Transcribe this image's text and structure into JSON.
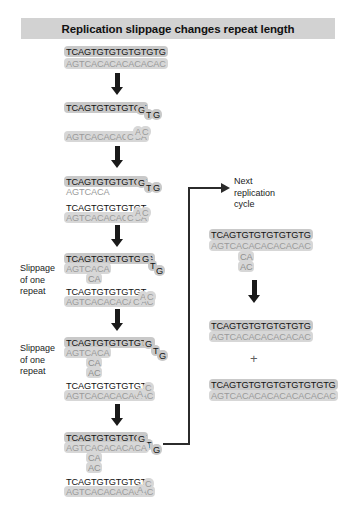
{
  "title": "Replication slippage changes repeat length",
  "labels": {
    "slippage_1": "Slippage\nof one\nrepeat",
    "slippage_2": "Slippage\nof one\nrepeat",
    "next_cycle": "Next\nreplication\ncycle",
    "plus": "+"
  },
  "colors": {
    "title_bg": "#d2d2d2",
    "top_strand_bg": "#c9c9c9",
    "bottom_strand_bg": "#d7d7d7",
    "top_strand_text": "#111111",
    "bottom_strand_text": "#9a9a9a",
    "arrow": "#1a1a1a",
    "connector": "#2b2b2b"
  },
  "left_column": {
    "step1": {
      "top": "TCAGTGTGTGTGTGTG",
      "bottom": "AGTCACACACACACAC"
    },
    "step2": {
      "top_main": "TCAGTGTGTGTGT",
      "top_loop": [
        "G",
        "T",
        "G"
      ],
      "bottom_main": "AGTCACACACACA",
      "bottom_loop": [
        "C",
        "A",
        "C"
      ]
    },
    "step3": {
      "upper_top": "TCAGTGTGTGTGT",
      "upper_top_loop": [
        "G",
        "T",
        "G"
      ],
      "upper_bottom": "AGTCACA",
      "lower_top": "TCAGTGTGTGTGT",
      "lower_bottom": "AGTCACACACACA",
      "lower_loop": [
        "C",
        "A",
        "C"
      ]
    },
    "step4": {
      "upper_top": "TCAGTGTGTGTGTG",
      "upper_top_loop": [
        "G",
        "T",
        "G"
      ],
      "upper_bottom": "AGTCACA",
      "bulges": [
        "CA"
      ],
      "lower_top": "TCAGTGTGTGTGT",
      "lower_bottom": "AGTCACACACACAC",
      "lower_loop": [
        "C",
        "A",
        "C"
      ]
    },
    "step5": {
      "upper_top": "TCAGTGTGTGTGTG",
      "upper_top_loop": [
        "G",
        "T",
        "G"
      ],
      "upper_bottom": "AGTCACA",
      "bulges": [
        "CA",
        "AC"
      ],
      "lower_top": "TCAGTGTGTGTGT",
      "lower_bottom": "AGTCACACACACAC",
      "lower_loop": [
        "A",
        "C"
      ]
    },
    "step6": {
      "upper_top": "TCAGTGTGTGTGT",
      "upper_top_loop": [
        "G",
        "T",
        "G"
      ],
      "upper_bottom": "AGTCACACACACA",
      "bulges": [
        "CA",
        "AC"
      ],
      "lower_top": "TCAGTGTGTGTGT",
      "lower_bottom": "AGTCACACACACAC",
      "lower_loop": [
        "A",
        "C"
      ]
    }
  },
  "right_column": {
    "duplex": {
      "top": "TCAGTGTGTGTGTGTG",
      "bottom": "AGTCACACACACACAC",
      "bulges": [
        "CA",
        "AC"
      ]
    },
    "product_1": {
      "top": "TCAGTGTGTGTGTGTG",
      "bottom": "AGTCACACACACACAC"
    },
    "product_2": {
      "top": "TCAGTGTGTGTGTGTGTGTG",
      "bottom": "AGTCACACACACACACACAC"
    }
  }
}
